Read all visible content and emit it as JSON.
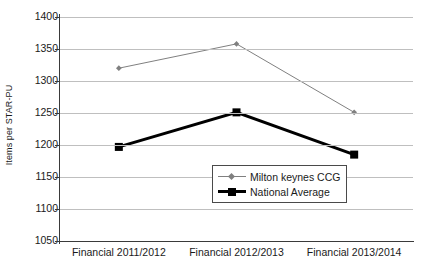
{
  "chart_data": {
    "type": "line",
    "title": "",
    "xlabel": "",
    "ylabel": "Items per STAR-PU",
    "ylim": [
      1050,
      1400
    ],
    "ytick_step": 50,
    "yticks": [
      1400,
      1350,
      1300,
      1250,
      1200,
      1150,
      1100,
      1050
    ],
    "grid": true,
    "legend_position": "inside-bottom-center",
    "categories": [
      "Financial 2011/2012",
      "Financial 2012/2013",
      "Financial 2013/2014"
    ],
    "series": [
      {
        "name": "Milton keynes CCG",
        "color": "#808080",
        "marker": "diamond",
        "line_width": 1,
        "values": [
          1320,
          1358,
          1251
        ]
      },
      {
        "name": "National Average",
        "color": "#000000",
        "marker": "square",
        "line_width": 3,
        "values": [
          1197,
          1251,
          1185
        ]
      }
    ]
  },
  "legend": {
    "items": [
      {
        "label": "Milton keynes CCG"
      },
      {
        "label": "National Average"
      }
    ]
  },
  "colors": {
    "gridline": "#bfbfbf",
    "axis": "#3a3a3a",
    "text": "#1a1a1a",
    "background": "#ffffff"
  }
}
